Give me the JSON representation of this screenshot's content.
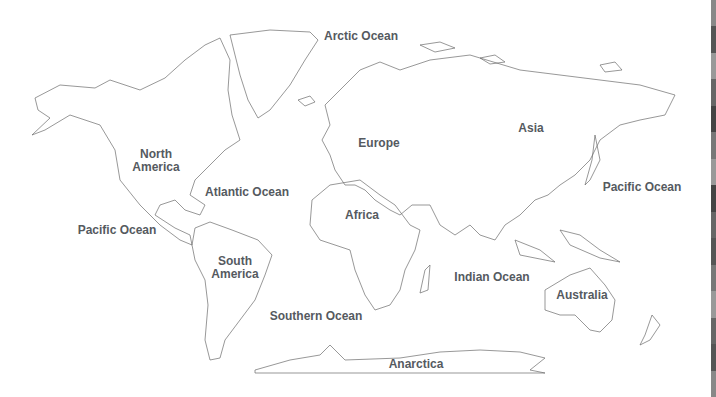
{
  "map": {
    "type": "world outline map",
    "labels": {
      "arctic_ocean": "Arctic Ocean",
      "north_america": "North\nAmerica",
      "atlantic_ocean": "Atlantic Ocean",
      "europe": "Europe",
      "asia": "Asia",
      "africa": "Africa",
      "pacific_ocean_west": "Pacific Ocean",
      "pacific_ocean_east": "Pacific Ocean",
      "south_america": "South\nAmerica",
      "indian_ocean": "Indian Ocean",
      "australia": "Australia",
      "southern_ocean": "Southern Ocean",
      "antarctica": "Anarctica"
    },
    "colors": {
      "outline": "#6b6b6b",
      "label": "#555a5f",
      "background": "#ffffff"
    }
  },
  "strip_colors": [
    "#888",
    "#555",
    "#999",
    "#666",
    "#444",
    "#777",
    "#999",
    "#444",
    "#666",
    "#555",
    "#777",
    "#999",
    "#666",
    "#555",
    "#888"
  ]
}
